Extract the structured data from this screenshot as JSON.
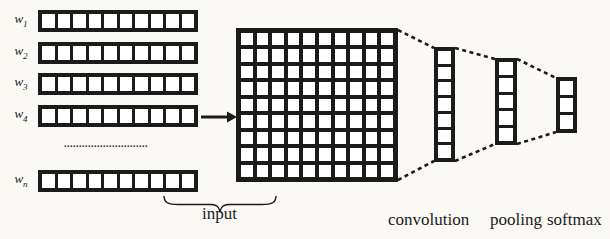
{
  "colors": {
    "ink": "#1b1b1b",
    "paper": "#fbf9f5",
    "cell_fill": "#ffffff"
  },
  "word_vectors": {
    "rows": [
      {
        "base": "w",
        "sub": "1",
        "cells": 10
      },
      {
        "base": "w",
        "sub": "2",
        "cells": 10
      },
      {
        "base": "w",
        "sub": "3",
        "cells": 10
      },
      {
        "base": "w",
        "sub": "4",
        "cells": 10
      },
      {
        "base": "w",
        "sub": "n",
        "cells": 10
      }
    ],
    "ellipsis": "............................"
  },
  "matrix": {
    "rows": 9,
    "cols": 10
  },
  "stages": [
    {
      "name": "convolution-output",
      "cells": 7
    },
    {
      "name": "pooling-output",
      "cells": 5
    },
    {
      "name": "softmax-output",
      "cells": 3
    }
  ],
  "labels": {
    "input": "input",
    "convolution": "convolution",
    "pooling": "pooling",
    "softmax": "softmax"
  }
}
